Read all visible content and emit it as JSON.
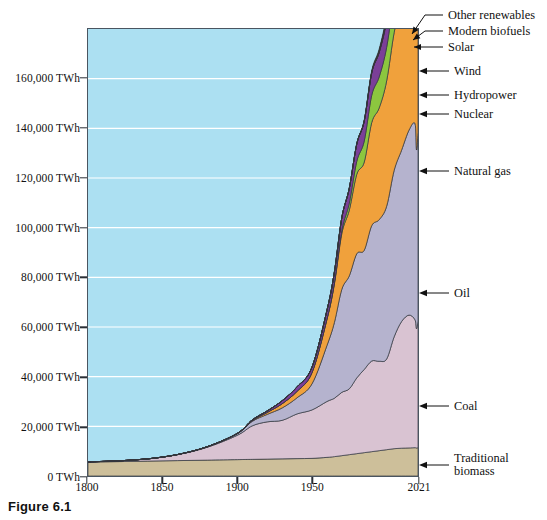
{
  "figure": {
    "caption": "Figure 6.1"
  },
  "axes": {
    "y_tick_labels": [
      "160,000 TWh",
      "140,000 TWh",
      "120,000 TWh",
      "100,000 TWh",
      "80,000 TWh",
      "60,000 TWh",
      "40,000 TWh",
      "20,000 TWh",
      "0 TWh"
    ],
    "y_tick_values": [
      160000,
      140000,
      120000,
      100000,
      80000,
      60000,
      40000,
      20000,
      0
    ],
    "x_tick_labels": [
      "1800",
      "1850",
      "1900",
      "1950",
      "2021"
    ],
    "x_tick_values": [
      1800,
      1850,
      1900,
      1950,
      2021
    ]
  },
  "callouts": [
    {
      "label": "Other renewables",
      "kind": "leader"
    },
    {
      "label": "Modern biofuels",
      "kind": "leader"
    },
    {
      "label": "Solar",
      "kind": "leader"
    },
    {
      "label": "Wind",
      "kind": "arrow"
    },
    {
      "label": "Hydropower",
      "kind": "arrow"
    },
    {
      "label": "Nuclear",
      "kind": "arrow"
    },
    {
      "label": "Natural gas",
      "kind": "arrow"
    },
    {
      "label": "Oil",
      "kind": "arrow"
    },
    {
      "label": "Coal",
      "kind": "arrow"
    },
    {
      "label": "Traditional biomass",
      "kind": "arrow"
    }
  ],
  "colors": {
    "plot_background": "#ace0f2",
    "gridline": "#ffffff",
    "frame": "#4a5560",
    "traditional_biomass": "#cdbf9a",
    "coal": "#d9c3d2",
    "oil": "#b5b3ce",
    "natural_gas": "#f0a13c",
    "nuclear": "#8cc63f",
    "hydropower": "#7b3f98",
    "wind": "#6aa84f",
    "solar": "#f2e63d",
    "modern_biofuels": "#8a3b1e",
    "other_renewables": "#3a2a1e"
  },
  "chart_data": {
    "type": "area",
    "stacked": true,
    "title": "",
    "xlabel": "",
    "ylabel": "TWh",
    "xlim": [
      1800,
      2021
    ],
    "ylim": [
      0,
      180000
    ],
    "grid": true,
    "legend_position": "right-callouts",
    "x": [
      1800,
      1820,
      1840,
      1860,
      1880,
      1900,
      1910,
      1920,
      1930,
      1940,
      1950,
      1960,
      1965,
      1970,
      1975,
      1980,
      1985,
      1990,
      1995,
      2000,
      2005,
      2010,
      2015,
      2019,
      2020,
      2021
    ],
    "series": [
      {
        "name": "Traditional biomass",
        "color": "#cdbf9a",
        "values": [
          5600,
          5800,
          6000,
          6200,
          6400,
          6600,
          6700,
          6800,
          6900,
          7000,
          7100,
          7500,
          7800,
          8200,
          8600,
          9000,
          9400,
          9800,
          10200,
          10600,
          11000,
          11200,
          11300,
          11400,
          11300,
          11400
        ]
      },
      {
        "name": "Coal",
        "color": "#d9c3d2",
        "values": [
          100,
          300,
          900,
          2400,
          5200,
          9800,
          13500,
          15000,
          15500,
          18000,
          19500,
          22500,
          23500,
          25500,
          26500,
          30500,
          33500,
          36500,
          36000,
          36500,
          45000,
          51000,
          53500,
          51500,
          48000,
          51000
        ]
      },
      {
        "name": "Oil",
        "color": "#b5b3ce",
        "values": [
          0,
          0,
          0,
          50,
          200,
          600,
          1800,
          3000,
          5000,
          6500,
          10500,
          22500,
          30500,
          41500,
          45500,
          50000,
          48000,
          54500,
          57000,
          61500,
          67000,
          69000,
          74500,
          79000,
          72000,
          76000
        ]
      },
      {
        "name": "Natural gas",
        "color": "#f0a13c",
        "values": [
          0,
          0,
          0,
          0,
          20,
          80,
          300,
          800,
          1700,
          2600,
          4500,
          10500,
          15500,
          22500,
          26500,
          32000,
          35500,
          41500,
          45000,
          50500,
          55500,
          60000,
          65000,
          72000,
          70000,
          73500
        ]
      },
      {
        "name": "Nuclear",
        "color": "#8cc63f",
        "values": [
          0,
          0,
          0,
          0,
          0,
          0,
          0,
          0,
          0,
          0,
          0,
          150,
          500,
          1200,
          2800,
          5200,
          8500,
          11000,
          12500,
          13500,
          14000,
          13500,
          12000,
          12500,
          12000,
          12500
        ]
      },
      {
        "name": "Hydropower",
        "color": "#7b3f98",
        "values": [
          0,
          0,
          0,
          0,
          0,
          100,
          300,
          600,
          1200,
          1800,
          2200,
          3500,
          4300,
          5200,
          6000,
          7000,
          8000,
          9000,
          9800,
          10500,
          11200,
          12500,
          13500,
          14500,
          14800,
          15000
        ]
      },
      {
        "name": "Wind",
        "color": "#6aa84f",
        "values": [
          0,
          0,
          0,
          0,
          0,
          0,
          0,
          0,
          0,
          0,
          0,
          0,
          0,
          0,
          0,
          0,
          20,
          100,
          250,
          800,
          1500,
          3000,
          6000,
          9500,
          10500,
          11500
        ]
      },
      {
        "name": "Solar",
        "color": "#f2e63d",
        "values": [
          0,
          0,
          0,
          0,
          0,
          0,
          0,
          0,
          0,
          0,
          0,
          0,
          0,
          0,
          0,
          0,
          0,
          10,
          30,
          80,
          200,
          700,
          2500,
          5500,
          6500,
          7800
        ]
      },
      {
        "name": "Modern biofuels",
        "color": "#8a3b1e",
        "values": [
          0,
          0,
          0,
          0,
          0,
          0,
          0,
          0,
          0,
          0,
          0,
          0,
          0,
          0,
          0,
          60,
          150,
          300,
          500,
          800,
          1400,
          2600,
          3600,
          4200,
          4100,
          4400
        ]
      },
      {
        "name": "Other renewables",
        "color": "#3a2a1e",
        "values": [
          0,
          0,
          0,
          0,
          0,
          0,
          0,
          0,
          0,
          0,
          0,
          0,
          0,
          20,
          60,
          120,
          250,
          450,
          700,
          1000,
          1400,
          2000,
          2800,
          3500,
          3600,
          3900
        ]
      }
    ]
  }
}
